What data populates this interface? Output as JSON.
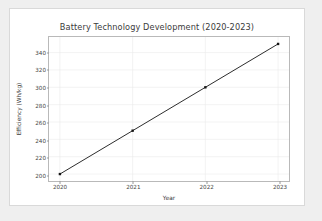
{
  "chart_data": {
    "type": "line",
    "title": "Battery Technology Development (2020-2023)",
    "xlabel": "Year",
    "ylabel": "Efficiency (Wh/kg)",
    "categories": [
      "2020",
      "2021",
      "2022",
      "2023"
    ],
    "x": [
      2020,
      2021,
      2022,
      2023
    ],
    "values": [
      200,
      250,
      300,
      350
    ],
    "series": [
      {
        "name": "Efficiency",
        "values": [
          200,
          250,
          300,
          350
        ]
      }
    ],
    "xtick_labels": [
      "2020",
      "2021",
      "2022",
      "2023"
    ],
    "ytick_labels": [
      "200",
      "220",
      "240",
      "260",
      "280",
      "300",
      "320",
      "340"
    ],
    "yticks": [
      200,
      220,
      240,
      260,
      280,
      300,
      320,
      340
    ],
    "xlim": [
      2019.85,
      2023.15
    ],
    "ylim": [
      192,
      358
    ],
    "grid": true,
    "legend": false,
    "marker": "square",
    "line_color": "#2a2a2a",
    "marker_color": "#151515",
    "grid_color": "#eaeaea",
    "axes_color": "#b9b9b9",
    "background": "#ffffff",
    "page_background": "#efefef"
  }
}
